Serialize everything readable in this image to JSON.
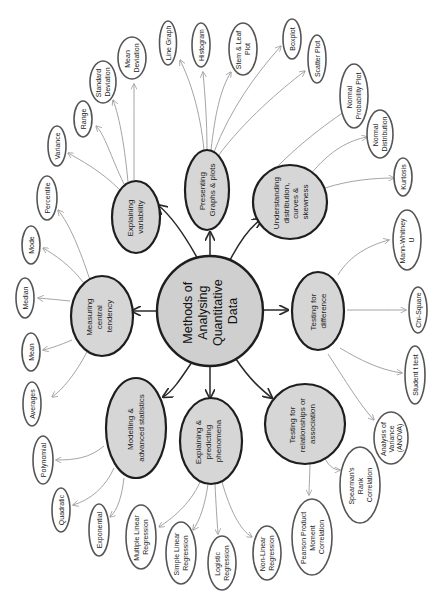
{
  "diagram": {
    "title": "Methods of Analysing Quantitative Data",
    "orientation": "rotated 90 degrees counter-clockwise",
    "center": {
      "lines": [
        "Methods of",
        "Analysing",
        "Quantitative",
        "Data"
      ]
    },
    "branches": [
      {
        "id": "presenting",
        "lines": [
          "Presenting",
          "Graphs & plots"
        ],
        "leaves": [
          {
            "lines": [
              "Line Graph"
            ]
          },
          {
            "lines": [
              "Histogram"
            ]
          },
          {
            "lines": [
              "Stem & Leaf",
              "Plot"
            ]
          },
          {
            "lines": [
              "Boxplot"
            ]
          },
          {
            "lines": [
              "Scatter Plot"
            ]
          }
        ]
      },
      {
        "id": "understanding",
        "lines": [
          "Understanding",
          "distribution,",
          "curves &",
          "skewness"
        ],
        "leaves": [
          {
            "lines": [
              "Normal",
              "Probability Plot"
            ]
          },
          {
            "lines": [
              "Normal",
              "Distribution"
            ]
          },
          {
            "lines": [
              "Kurtosis"
            ]
          }
        ]
      },
      {
        "id": "differences",
        "lines": [
          "Testing for",
          "difference"
        ],
        "leaves": [
          {
            "lines": [
              "Mann-Whitney",
              "U"
            ]
          },
          {
            "lines": [
              "Chi-Square"
            ]
          },
          {
            "lines": [
              "Student t test"
            ]
          },
          {
            "lines": [
              "Analysis of",
              "Variance",
              "(ANOVA)"
            ]
          }
        ]
      },
      {
        "id": "relationships",
        "lines": [
          "Testing for",
          "relationships or",
          "association"
        ],
        "leaves": [
          {
            "lines": [
              "Spearman's",
              "Rank",
              "Correlation"
            ]
          },
          {
            "lines": [
              "Pearson Product",
              "Moment",
              "Correlation"
            ]
          }
        ]
      },
      {
        "id": "predicting",
        "lines": [
          "Explaining &",
          "predicting",
          "phenomena"
        ],
        "leaves": [
          {
            "lines": [
              "Multiple Linear",
              "Regression"
            ]
          },
          {
            "lines": [
              "Simple Linear",
              "Regression"
            ]
          },
          {
            "lines": [
              "Logistic",
              "Regression"
            ]
          },
          {
            "lines": [
              "Non-Linear",
              "Regression"
            ]
          }
        ]
      },
      {
        "id": "modelling",
        "lines": [
          "Modelling &",
          "advanced statistics"
        ],
        "leaves": [
          {
            "lines": [
              "Polynomial"
            ]
          },
          {
            "lines": [
              "Quadratic"
            ]
          },
          {
            "lines": [
              "Exponential"
            ]
          }
        ]
      },
      {
        "id": "central",
        "lines": [
          "Measuring",
          "central",
          "tendency"
        ],
        "leaves": [
          {
            "lines": [
              "Percentile"
            ]
          },
          {
            "lines": [
              "Mode"
            ]
          },
          {
            "lines": [
              "Median"
            ]
          },
          {
            "lines": [
              "Mean"
            ]
          },
          {
            "lines": [
              "Averages"
            ]
          }
        ]
      },
      {
        "id": "variability",
        "lines": [
          "Explaining",
          "variability"
        ],
        "leaves": [
          {
            "lines": [
              "Variance"
            ]
          },
          {
            "lines": [
              "Range"
            ]
          },
          {
            "lines": [
              "Standard",
              "Deviation"
            ]
          },
          {
            "lines": [
              "Mean",
              "Deviation"
            ]
          }
        ]
      }
    ],
    "colors": {
      "node_fill": "#d6d6d6",
      "node_border": "#1e1e1e",
      "leaf_fill": "#ffffff",
      "leaf_border": "#555555",
      "leaf_edge": "#9a9a9a",
      "main_edge": "#2a2a2a"
    }
  }
}
